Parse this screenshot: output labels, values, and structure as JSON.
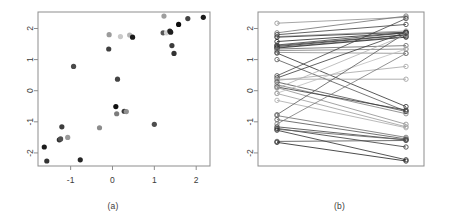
{
  "figure": {
    "width": 453,
    "height": 217,
    "background": "#ffffff"
  },
  "panels": [
    {
      "id": "a",
      "caption": "(a)"
    },
    {
      "id": "b",
      "caption": "(b)"
    }
  ],
  "chart_data": [
    {
      "type": "scatter",
      "panel": "(a)",
      "title": "",
      "xlabel": "",
      "ylabel": "",
      "xlim": [
        -1.78,
        2.33
      ],
      "ylim": [
        -2.42,
        2.53
      ],
      "xticks": [
        -1,
        0,
        1,
        2
      ],
      "xticklabels": [
        "-1",
        "0",
        "1",
        "2"
      ],
      "yticks": [
        -2,
        -1,
        0,
        1,
        2
      ],
      "yticklabels": [
        "-2",
        "-1",
        "0",
        "1",
        "2"
      ],
      "grid": false,
      "legend": null,
      "frame": true,
      "marker": "filled-circle",
      "point_radius_px": 2.6,
      "points": [
        {
          "x": -1.63,
          "y": -1.81,
          "color": "#1c1c1c"
        },
        {
          "x": -1.57,
          "y": -2.26,
          "color": "#333333"
        },
        {
          "x": -1.27,
          "y": -1.58,
          "color": "#2b2b2b"
        },
        {
          "x": -1.24,
          "y": -1.55,
          "color": "#4f4f4f"
        },
        {
          "x": -1.21,
          "y": -1.16,
          "color": "#3d3d3d"
        },
        {
          "x": -1.07,
          "y": -1.5,
          "color": "#9a9a9a"
        },
        {
          "x": -0.93,
          "y": 0.78,
          "color": "#4a4a4a"
        },
        {
          "x": -0.77,
          "y": -2.22,
          "color": "#262626"
        },
        {
          "x": -0.31,
          "y": -1.19,
          "color": "#8c8c8c"
        },
        {
          "x": -0.09,
          "y": 1.34,
          "color": "#3f3f3f"
        },
        {
          "x": -0.08,
          "y": 1.8,
          "color": "#9b9b9b"
        },
        {
          "x": 0.08,
          "y": -0.51,
          "color": "#111111"
        },
        {
          "x": 0.1,
          "y": -0.74,
          "color": "#7c7c7c"
        },
        {
          "x": 0.12,
          "y": 0.37,
          "color": "#444444"
        },
        {
          "x": 0.19,
          "y": 1.74,
          "color": "#c9c9c9"
        },
        {
          "x": 0.28,
          "y": -0.66,
          "color": "#3a3a3a"
        },
        {
          "x": 0.33,
          "y": -0.67,
          "color": "#8f8f8f"
        },
        {
          "x": 0.41,
          "y": 1.79,
          "color": "#b4b4b4"
        },
        {
          "x": 0.48,
          "y": 1.72,
          "color": "#1a1a1a"
        },
        {
          "x": 1.0,
          "y": -1.08,
          "color": "#4d4d4d"
        },
        {
          "x": 1.21,
          "y": 1.86,
          "color": "#565656"
        },
        {
          "x": 1.23,
          "y": 2.4,
          "color": "#9e9e9e"
        },
        {
          "x": 1.29,
          "y": 1.86,
          "color": "#d2d2d2"
        },
        {
          "x": 1.37,
          "y": 1.92,
          "color": "#2a2a2a"
        },
        {
          "x": 1.39,
          "y": 1.88,
          "color": "#1e1e1e"
        },
        {
          "x": 1.42,
          "y": 1.45,
          "color": "#3c3c3c"
        },
        {
          "x": 1.47,
          "y": 1.2,
          "color": "#333333"
        },
        {
          "x": 1.58,
          "y": 2.13,
          "color": "#0d0d0d"
        },
        {
          "x": 1.8,
          "y": 2.32,
          "color": "#434343"
        },
        {
          "x": 2.17,
          "y": 2.36,
          "color": "#1b1b1b"
        }
      ]
    },
    {
      "type": "line",
      "panel": "(b)",
      "title": "",
      "xlabel": "",
      "ylabel": "",
      "xlim": [
        0,
        1
      ],
      "ylim": [
        -2.42,
        2.53
      ],
      "xticks": [],
      "xticklabels": [],
      "yticks": [
        -2,
        -1,
        0,
        1,
        2
      ],
      "yticklabels": [
        "-2",
        "-1",
        "0",
        "1",
        "2"
      ],
      "grid": false,
      "legend": null,
      "frame": true,
      "marker": "open-circle",
      "marker_radius_px": 2.2,
      "description": "Parallel-coordinate slope plot connecting left-column values to right-column values",
      "series": [
        {
          "name": "1",
          "left": 2.17,
          "right": 2.36,
          "color": "#8e8e8e"
        },
        {
          "name": "2",
          "left": 1.86,
          "right": 2.4,
          "color": "#6f6f6f"
        },
        {
          "name": "3",
          "left": 1.8,
          "right": 2.13,
          "color": "#3b3b3b"
        },
        {
          "name": "4",
          "left": 1.74,
          "right": 1.92,
          "color": "#909090"
        },
        {
          "name": "5",
          "left": 1.72,
          "right": 1.88,
          "color": "#2a2a2a"
        },
        {
          "name": "6",
          "left": 1.58,
          "right": 1.86,
          "color": "#1f1f1f"
        },
        {
          "name": "7",
          "left": 1.47,
          "right": 1.86,
          "color": "#3f3f3f"
        },
        {
          "name": "8",
          "left": 1.45,
          "right": 1.8,
          "color": "#4a4a4a"
        },
        {
          "name": "9",
          "left": 1.42,
          "right": 1.79,
          "color": "#2d2d2d"
        },
        {
          "name": "10",
          "left": 1.39,
          "right": 1.74,
          "color": "#575757"
        },
        {
          "name": "11",
          "left": 1.37,
          "right": 1.72,
          "color": "#232323"
        },
        {
          "name": "12",
          "left": 1.34,
          "right": 1.45,
          "color": "#666666"
        },
        {
          "name": "13",
          "left": 1.29,
          "right": 1.34,
          "color": "#7b7b7b"
        },
        {
          "name": "14",
          "left": 1.23,
          "right": 1.2,
          "color": "#8a8a8a"
        },
        {
          "name": "15",
          "left": 1.21,
          "right": -0.51,
          "color": "#2e2e2e"
        },
        {
          "name": "16",
          "left": 1.0,
          "right": -0.66,
          "color": "#545454"
        },
        {
          "name": "17",
          "left": 0.48,
          "right": 2.32,
          "color": "#444444"
        },
        {
          "name": "18",
          "left": 0.41,
          "right": 1.88,
          "color": "#3a3a3a"
        },
        {
          "name": "19",
          "left": 0.37,
          "right": 0.37,
          "color": "#9c9c9c"
        },
        {
          "name": "20",
          "left": 0.33,
          "right": 0.78,
          "color": "#a5a5a5"
        },
        {
          "name": "21",
          "left": 0.28,
          "right": -0.67,
          "color": "#4d4d4d"
        },
        {
          "name": "22",
          "left": 0.19,
          "right": -0.74,
          "color": "#7a7a7a"
        },
        {
          "name": "23",
          "left": 0.12,
          "right": -0.62,
          "color": "#333333"
        },
        {
          "name": "24",
          "left": 0.1,
          "right": -1.08,
          "color": "#8d8d8d"
        },
        {
          "name": "25",
          "left": 0.08,
          "right": 1.8,
          "color": "#b0b0b0"
        },
        {
          "name": "26",
          "left": -0.08,
          "right": 1.34,
          "color": "#bcbcbc"
        },
        {
          "name": "27",
          "left": -0.09,
          "right": -1.16,
          "color": "#9a9a9a"
        },
        {
          "name": "28",
          "left": -0.31,
          "right": -1.19,
          "color": "#a8a8a8"
        },
        {
          "name": "29",
          "left": -0.77,
          "right": 1.86,
          "color": "#595959"
        },
        {
          "name": "30",
          "left": -0.8,
          "right": -1.5,
          "color": "#6b6b6b"
        },
        {
          "name": "31",
          "left": -0.93,
          "right": -1.55,
          "color": "#4f4f4f"
        },
        {
          "name": "32",
          "left": -1.07,
          "right": 1.2,
          "color": "#787878"
        },
        {
          "name": "33",
          "left": -1.16,
          "right": -1.58,
          "color": "#3e3e3e"
        },
        {
          "name": "34",
          "left": -1.21,
          "right": -1.81,
          "color": "#353535"
        },
        {
          "name": "35",
          "left": -1.24,
          "right": -1.58,
          "color": "#5c5c5c"
        },
        {
          "name": "36",
          "left": -1.27,
          "right": -2.22,
          "color": "#2b2b2b"
        },
        {
          "name": "37",
          "left": -1.63,
          "right": -1.6,
          "color": "#4a4a4a"
        },
        {
          "name": "38",
          "left": -1.66,
          "right": -2.26,
          "color": "#1d1d1d"
        }
      ]
    }
  ],
  "colors": {
    "frame": "#8d8d8d",
    "axis_text": "#3b3b3b",
    "tick": "#8d8d8d",
    "background": "#ffffff"
  }
}
